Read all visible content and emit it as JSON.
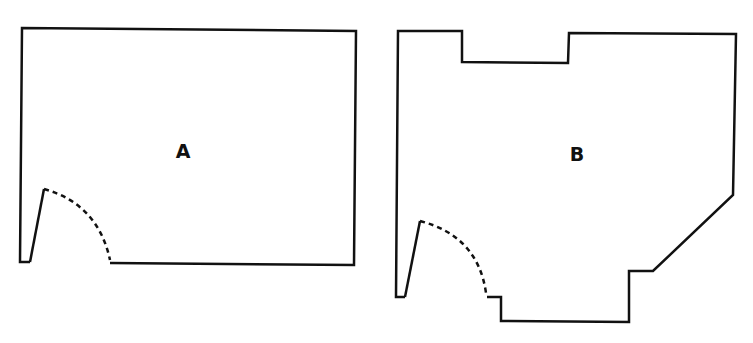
{
  "rooms": [
    {
      "label": "A",
      "label_pos": [
        183,
        151
      ],
      "walls": "M110,263 L354,265 L356,31 L22,28 L20,262 L30,262",
      "door_leaf": "M30,262 L44,189",
      "door_swing": "M44,189 Q98,204 110,260"
    },
    {
      "label": "B",
      "label_pos": [
        577,
        154
      ],
      "walls": "M487,297 L501,297 L501,321 L629,322 L629,271 L653,271 L733,195 L736,34 L569,33 L568,63 L462,62 L462,31 L398,31 L396,297 L405,297",
      "door_leaf": "M405,297 L420,221",
      "door_swing": "M420,221 Q478,236 486,293"
    }
  ],
  "colors": {
    "line": "#111111",
    "background": "#ffffff"
  }
}
